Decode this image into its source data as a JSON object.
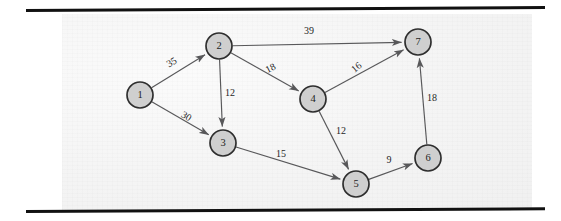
{
  "figure": {
    "type": "directed-weighted-graph",
    "background_color": "#f2f2f2",
    "node_fill_color": "#cfcfcf",
    "node_stroke_color": "#2e2e2e",
    "edge_color": "#58585a",
    "rule_color": "#111111"
  },
  "chart_data": {
    "type": "diagram",
    "title": "",
    "xlabel": "",
    "ylabel": "",
    "nodes": [
      {
        "id": "1",
        "label": "1",
        "x": 140,
        "y": 95,
        "r": 13
      },
      {
        "id": "2",
        "label": "2",
        "x": 219,
        "y": 46,
        "r": 13
      },
      {
        "id": "3",
        "label": "3",
        "x": 223,
        "y": 143,
        "r": 13
      },
      {
        "id": "4",
        "label": "4",
        "x": 313,
        "y": 99,
        "r": 13
      },
      {
        "id": "5",
        "label": "5",
        "x": 356,
        "y": 184,
        "r": 13
      },
      {
        "id": "6",
        "label": "6",
        "x": 428,
        "y": 158,
        "r": 13
      },
      {
        "id": "7",
        "label": "7",
        "x": 418,
        "y": 42,
        "r": 13
      }
    ],
    "edges": [
      {
        "from": "1",
        "to": "2",
        "weight": "35",
        "label_x": 172,
        "label_y": 63,
        "label_rotation": -31
      },
      {
        "from": "1",
        "to": "3",
        "weight": "30",
        "label_x": 186,
        "label_y": 117,
        "label_rotation": 31
      },
      {
        "from": "2",
        "to": "7",
        "weight": "39",
        "label_x": 309,
        "label_y": 32,
        "label_rotation": 0
      },
      {
        "from": "2",
        "to": "3",
        "weight": "12",
        "label_x": 230,
        "label_y": 94,
        "label_rotation": 0
      },
      {
        "from": "2",
        "to": "4",
        "weight": "18",
        "label_x": 271,
        "label_y": 69,
        "label_rotation": -27
      },
      {
        "from": "4",
        "to": "7",
        "weight": "16",
        "label_x": 357,
        "label_y": 68,
        "label_rotation": -39
      },
      {
        "from": "4",
        "to": "5",
        "weight": "12",
        "label_x": 341,
        "label_y": 132,
        "label_rotation": 0
      },
      {
        "from": "3",
        "to": "5",
        "weight": "15",
        "label_x": 281,
        "label_y": 155,
        "label_rotation": 0
      },
      {
        "from": "5",
        "to": "6",
        "weight": "9",
        "label_x": 389,
        "label_y": 161,
        "label_rotation": 0
      },
      {
        "from": "6",
        "to": "7",
        "weight": "18",
        "label_x": 432,
        "label_y": 99,
        "label_rotation": 0
      }
    ]
  }
}
